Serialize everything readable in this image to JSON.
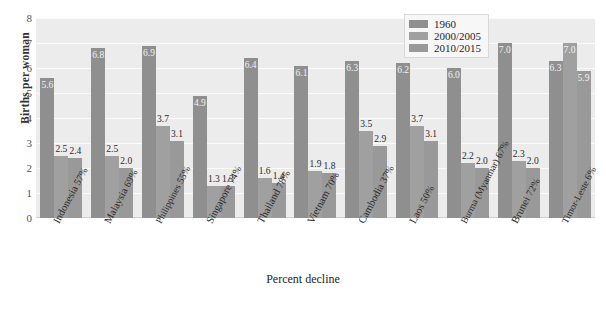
{
  "chart_data": {
    "type": "bar",
    "title": "",
    "xlabel": "Percent decline",
    "ylabel": "Births per woman",
    "ylim": [
      0,
      8
    ],
    "yticks": [
      8,
      7,
      6,
      5,
      4,
      3,
      2,
      1,
      0
    ],
    "grid": true,
    "legend_position": "top-right",
    "categories": [
      "Indonesia",
      "Malaysia",
      "Philippines",
      "Singapore",
      "Thailand",
      "Vietnam",
      "Cambodia",
      "Laos",
      "Burma (Myanmar)",
      "Brunei",
      "Timor-Leste"
    ],
    "category_sublabels": [
      "57%",
      "69%",
      "55%",
      "74%",
      "78%",
      "70%",
      "37%",
      "50%",
      "67%",
      "72%",
      "6%"
    ],
    "series": [
      {
        "name": "1960",
        "color": "#8f8f8f",
        "values": [
          5.6,
          6.8,
          6.9,
          4.9,
          6.4,
          6.1,
          6.3,
          6.2,
          6.0,
          7.0,
          6.3
        ]
      },
      {
        "name": "2000/2005",
        "color": "#a0a0a0",
        "values": [
          2.5,
          2.5,
          3.7,
          1.3,
          1.6,
          1.9,
          3.5,
          3.7,
          2.2,
          2.3,
          7.0
        ]
      },
      {
        "name": "2010/2015",
        "color": "#999999",
        "values": [
          2.4,
          2.0,
          3.1,
          1.3,
          1.4,
          1.8,
          2.9,
          3.1,
          2.0,
          2.0,
          5.9
        ]
      }
    ],
    "plot_background": "#ececec",
    "gridline_color": "#fbfbfb"
  }
}
